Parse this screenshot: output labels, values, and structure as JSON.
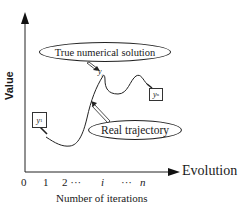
{
  "diagram": {
    "y_axis": {
      "label": "Value"
    },
    "x_axis": {
      "label": "Evolution",
      "title": "Number of iterations",
      "ticks": [
        {
          "text": "0",
          "italic": false,
          "x": 21
        },
        {
          "text": "1",
          "italic": false,
          "x": 43
        },
        {
          "text": "2 ···",
          "italic": false,
          "x": 62
        },
        {
          "text": "i",
          "italic": true,
          "x": 101
        },
        {
          "text": "···",
          "italic": false,
          "x": 121
        },
        {
          "text": "n",
          "italic": true,
          "x": 140
        }
      ]
    },
    "callouts": {
      "true_solution": "True numerical solution",
      "real_trajectory": "Real trajectory"
    },
    "points": {
      "y1": {
        "base": "y",
        "sub": "1"
      },
      "yi": {
        "base": "y",
        "sub": "i"
      },
      "yn": {
        "base": "y",
        "sub": "n"
      }
    },
    "colors": {
      "ink": "#1a1a1a",
      "background": "#ffffff"
    }
  }
}
